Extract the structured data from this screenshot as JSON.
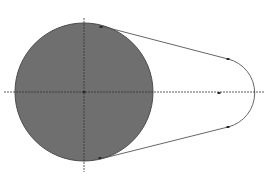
{
  "diagram": {
    "type": "belt-pulley-tangent-construction",
    "colors": {
      "background": "#ffffff",
      "large_circle_fill": "#6f6f6f",
      "large_circle_stroke": "#4a4a4a",
      "outline": "#555555",
      "centerline": "#333333",
      "marker": "#2a2a2a"
    },
    "large_circle": {
      "cx": 84,
      "cy": 92,
      "r": 69
    },
    "small_arc": {
      "cx": 221,
      "cy": 93,
      "r": 35
    },
    "tangent_top": {
      "x1": 101,
      "y1": 26,
      "x2": 228,
      "y2": 59
    },
    "tangent_bottom": {
      "x1": 100,
      "y1": 159,
      "x2": 228,
      "y2": 127
    },
    "horizontal_centerline": {
      "x1": 4,
      "y": 92,
      "x2": 264
    },
    "vertical_centerline": {
      "x": 84,
      "y1": 18,
      "y2": 172
    },
    "markers": [
      {
        "name": "tangent-point-top-large",
        "x": 101,
        "y": 27
      },
      {
        "name": "tangent-point-bottom-large",
        "x": 100,
        "y": 158
      },
      {
        "name": "tangent-point-top-small",
        "x": 228,
        "y": 59
      },
      {
        "name": "tangent-point-bottom-small",
        "x": 228,
        "y": 127
      },
      {
        "name": "center-large",
        "x": 84,
        "y": 92
      },
      {
        "name": "center-small",
        "x": 219,
        "y": 93
      }
    ]
  }
}
